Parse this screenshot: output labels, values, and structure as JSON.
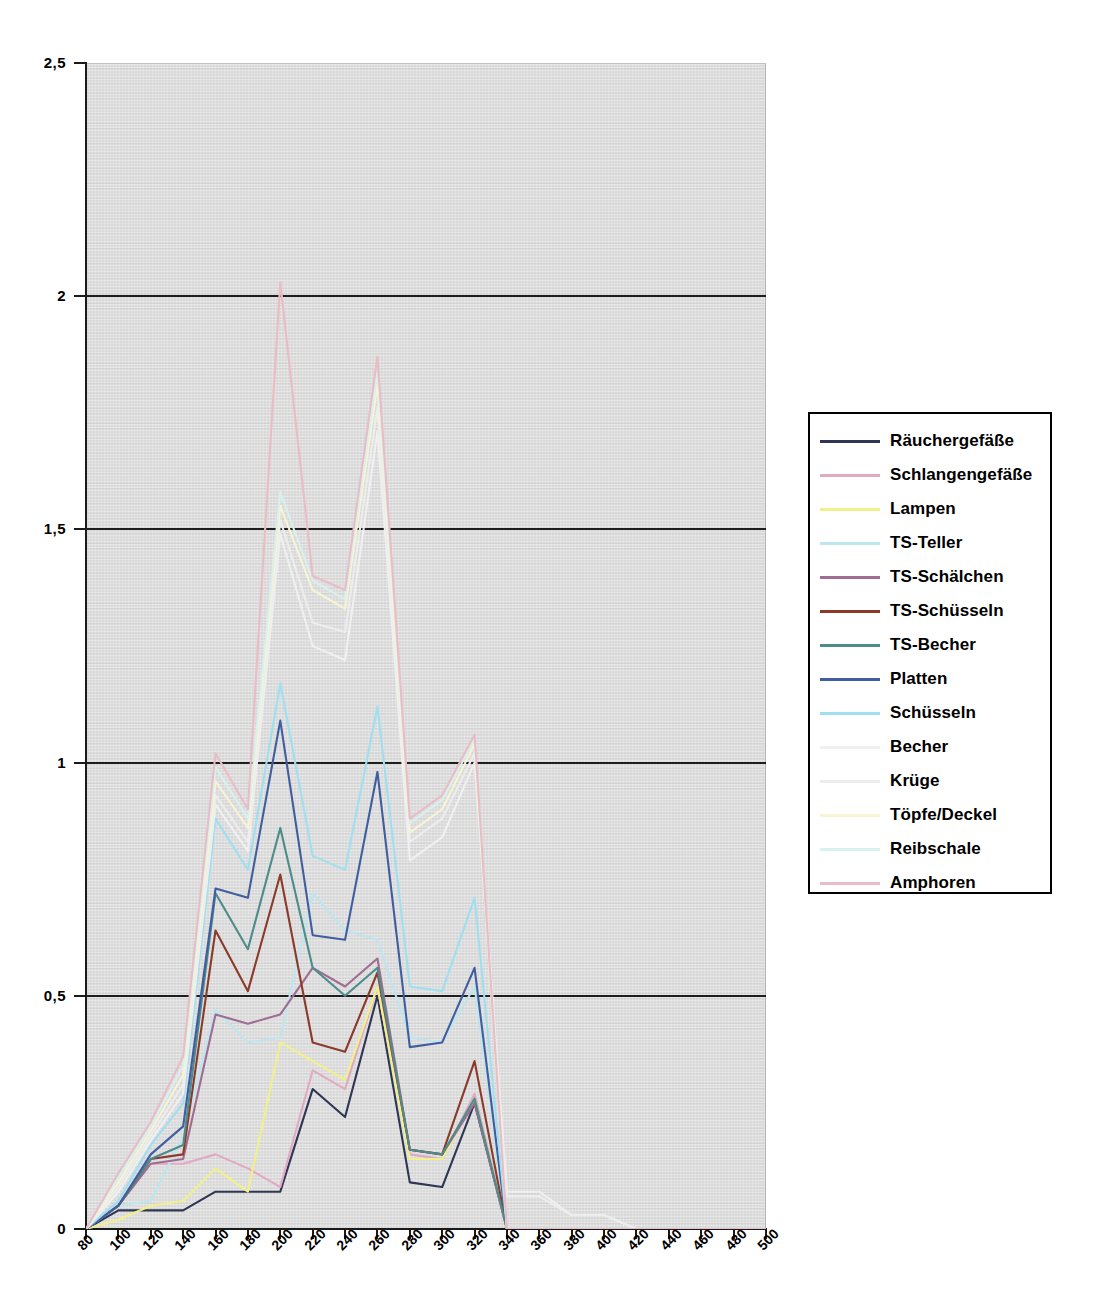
{
  "chart_data": {
    "type": "line",
    "title": "",
    "xlabel": "",
    "ylabel": "",
    "xlim": [
      80,
      500
    ],
    "ylim": [
      0,
      2.5
    ],
    "grid": true,
    "legend_position": "right",
    "x": [
      80,
      100,
      120,
      140,
      160,
      180,
      200,
      220,
      240,
      260,
      280,
      300,
      320,
      340,
      360,
      380,
      400,
      420,
      440,
      460,
      480,
      500
    ],
    "yticks": [
      "0",
      "0,5",
      "1",
      "1,5",
      "2",
      "2,5"
    ],
    "ytick_values": [
      0,
      0.5,
      1,
      1.5,
      2,
      2.5
    ],
    "xticks": [
      "80",
      "100",
      "120",
      "140",
      "160",
      "180",
      "200",
      "220",
      "240",
      "260",
      "280",
      "300",
      "320",
      "340",
      "360",
      "380",
      "400",
      "420",
      "440",
      "460",
      "480",
      "500"
    ],
    "series": [
      {
        "name": "Räuchergefäße",
        "color": "#2f3654",
        "values": [
          0,
          0.04,
          0.04,
          0.04,
          0.08,
          0.08,
          0.08,
          0.3,
          0.24,
          0.5,
          0.1,
          0.09,
          0.27,
          0,
          0,
          0,
          0,
          0,
          0,
          0,
          0,
          0
        ]
      },
      {
        "name": "Schlangengefäße",
        "color": "#e2a9c2",
        "values": [
          0,
          0.05,
          0.14,
          0.14,
          0.16,
          0.13,
          0.09,
          0.34,
          0.3,
          0.52,
          0.16,
          0.15,
          0.29,
          0,
          0,
          0,
          0,
          0,
          0,
          0,
          0,
          0
        ]
      },
      {
        "name": "Lampen",
        "color": "#f2f08a",
        "values": [
          0,
          0.02,
          0.05,
          0.06,
          0.13,
          0.08,
          0.4,
          0.36,
          0.32,
          0.52,
          0.15,
          0.15,
          0.28,
          0,
          0,
          0,
          0,
          0,
          0,
          0,
          0,
          0
        ]
      },
      {
        "name": "TS-Teller",
        "color": "#bde6ef",
        "values": [
          0,
          0.05,
          0.06,
          0.2,
          0.47,
          0.4,
          0.41,
          0.72,
          0.64,
          0.62,
          0.41,
          0.4,
          0.52,
          0,
          0,
          0,
          0,
          0,
          0,
          0,
          0,
          0
        ]
      },
      {
        "name": "TS-Schälchen",
        "color": "#9f6c92",
        "values": [
          0,
          0.05,
          0.14,
          0.15,
          0.46,
          0.44,
          0.46,
          0.56,
          0.52,
          0.58,
          0.17,
          0.16,
          0.27,
          0,
          0,
          0,
          0,
          0,
          0,
          0,
          0,
          0
        ]
      },
      {
        "name": "TS-Schüsseln",
        "color": "#8b3a2a",
        "values": [
          0,
          0.05,
          0.15,
          0.16,
          0.64,
          0.51,
          0.76,
          0.4,
          0.38,
          0.55,
          0.17,
          0.16,
          0.36,
          0,
          0,
          0,
          0,
          0,
          0,
          0,
          0,
          0
        ]
      },
      {
        "name": "TS-Becher",
        "color": "#4e8b8b",
        "values": [
          0,
          0.05,
          0.15,
          0.18,
          0.72,
          0.6,
          0.86,
          0.56,
          0.5,
          0.56,
          0.17,
          0.16,
          0.28,
          0,
          0,
          0,
          0,
          0,
          0,
          0,
          0,
          0
        ]
      },
      {
        "name": "Platten",
        "color": "#3f5ea0",
        "values": [
          0,
          0.05,
          0.16,
          0.22,
          0.73,
          0.71,
          1.09,
          0.63,
          0.62,
          0.98,
          0.39,
          0.4,
          0.56,
          0,
          0,
          0,
          0,
          0,
          0,
          0,
          0,
          0
        ]
      },
      {
        "name": "Schüsseln",
        "color": "#9fdff0",
        "values": [
          0,
          0.06,
          0.18,
          0.27,
          0.88,
          0.77,
          1.17,
          0.8,
          0.77,
          1.12,
          0.52,
          0.51,
          0.71,
          0,
          0,
          0,
          0,
          0,
          0,
          0,
          0,
          0
        ]
      },
      {
        "name": "Becher",
        "color": "#f0f0f0",
        "values": [
          0,
          0.08,
          0.19,
          0.29,
          0.91,
          0.81,
          1.49,
          1.25,
          1.22,
          1.71,
          0.79,
          0.84,
          1.0,
          0.08,
          0.08,
          0.03,
          0.03,
          0,
          0,
          0,
          0,
          0
        ]
      },
      {
        "name": "Krüge",
        "color": "#ededed",
        "values": [
          0,
          0.09,
          0.2,
          0.31,
          0.93,
          0.83,
          1.52,
          1.3,
          1.28,
          1.76,
          0.83,
          0.88,
          1.02,
          0.07,
          0.07,
          0.03,
          0.03,
          0,
          0,
          0,
          0,
          0
        ]
      },
      {
        "name": "Töpfe/Deckel",
        "color": "#f7f4d4",
        "values": [
          0,
          0.1,
          0.21,
          0.33,
          0.96,
          0.86,
          1.55,
          1.37,
          1.33,
          1.81,
          0.85,
          0.9,
          1.04,
          0,
          0,
          0,
          0,
          0,
          0,
          0,
          0,
          0
        ]
      },
      {
        "name": "Reibschale",
        "color": "#d8f0ee",
        "values": [
          0,
          0.11,
          0.22,
          0.35,
          0.99,
          0.88,
          1.58,
          1.39,
          1.35,
          1.84,
          0.87,
          0.92,
          1.05,
          0,
          0,
          0,
          0,
          0,
          0,
          0,
          0,
          0
        ]
      },
      {
        "name": "Amphoren",
        "color": "#e9bcc6",
        "values": [
          0,
          0.12,
          0.23,
          0.37,
          1.02,
          0.9,
          2.03,
          1.4,
          1.37,
          1.87,
          0.88,
          0.93,
          1.06,
          0,
          0,
          0,
          0,
          0,
          0,
          0,
          0,
          0
        ]
      }
    ]
  },
  "legend": {
    "items": [
      {
        "label": "Räuchergefäße",
        "color": "#2f3654",
        "has_swatch": true
      },
      {
        "label": "Schlangengefäße",
        "color": "#e2a9c2",
        "has_swatch": true
      },
      {
        "label": "Lampen",
        "color": "#f2f08a",
        "has_swatch": true
      },
      {
        "label": "TS-Teller",
        "color": "#bde6ef",
        "has_swatch": true
      },
      {
        "label": "TS-Schälchen",
        "color": "#9f6c92",
        "has_swatch": true
      },
      {
        "label": "TS-Schüsseln",
        "color": "#8b3a2a",
        "has_swatch": true
      },
      {
        "label": "TS-Becher",
        "color": "#4e8b8b",
        "has_swatch": true
      },
      {
        "label": "Platten",
        "color": "#3f5ea0",
        "has_swatch": true
      },
      {
        "label": "Schüsseln",
        "color": "#9fdff0",
        "has_swatch": true
      },
      {
        "label": "Becher",
        "color": "#f0f0f0",
        "has_swatch": true
      },
      {
        "label": "Krüge",
        "color": "#ededed",
        "has_swatch": true
      },
      {
        "label": "Töpfe/Deckel",
        "color": "#f7f4d4",
        "has_swatch": true
      },
      {
        "label": "Reibschale",
        "color": "#d8f0ee",
        "has_swatch": true
      },
      {
        "label": "Amphoren",
        "color": "#e9bcc6",
        "has_swatch": true
      }
    ]
  },
  "plot_style": {
    "background": "#d9d9d9",
    "gridline_color": "#1d1d1d",
    "axis_color": "#1a1a1a"
  }
}
